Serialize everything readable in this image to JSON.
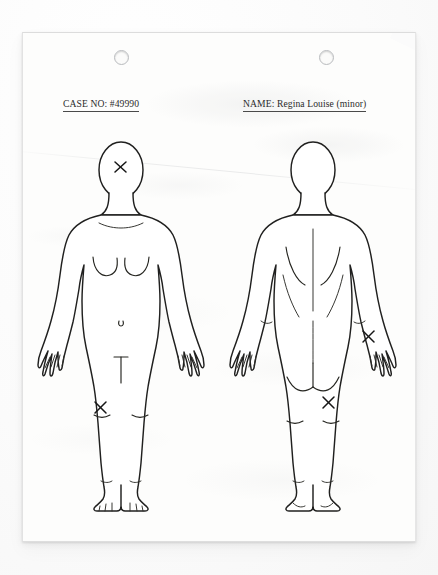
{
  "document": {
    "type": "forensic-body-injury-chart",
    "paper_color": "#fdfdfc",
    "ink_color": "#20201f"
  },
  "header": {
    "case_field": {
      "label": "CASE NO:",
      "value": "#49990",
      "text": "CASE NO: #49990"
    },
    "name_field": {
      "label": "NAME:",
      "value": "Regina Louise (minor)",
      "text": "NAME: Regina Louise (minor)"
    }
  },
  "binder_holes": [
    {
      "name": "hole-left"
    },
    {
      "name": "hole-right"
    }
  ],
  "figures": [
    {
      "id": "front",
      "view": "anterior",
      "marks": [
        {
          "id": "front-head",
          "location": "forehead",
          "symbol": "X"
        },
        {
          "id": "front-knee",
          "location": "right-knee",
          "symbol": "X"
        }
      ]
    },
    {
      "id": "back",
      "view": "posterior",
      "marks": [
        {
          "id": "back-forearm",
          "location": "left-forearm",
          "symbol": "X"
        },
        {
          "id": "back-thigh",
          "location": "left-lower-thigh",
          "symbol": "X"
        }
      ]
    }
  ]
}
